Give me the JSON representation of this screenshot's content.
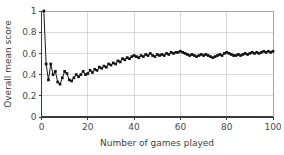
{
  "chart_data": {
    "type": "line",
    "title": "",
    "xlabel": "Number of games played",
    "ylabel": "Overall mean score",
    "xlim": [
      0,
      100
    ],
    "ylim": [
      0,
      1
    ],
    "grid": true,
    "legend": "none",
    "marker": "filled-square",
    "line_color": "#1a1a1a",
    "xticks": [
      0,
      20,
      40,
      60,
      80,
      100
    ],
    "xtick_labels": [
      "0",
      "20",
      "40",
      "60",
      "80",
      "100"
    ],
    "yticks": [
      0,
      0.2,
      0.4,
      0.6,
      0.8,
      1
    ],
    "ytick_labels": [
      "0",
      "0.2",
      "0.4",
      "0.6",
      "0.8",
      "1"
    ],
    "series": [
      {
        "name": "Overall mean score",
        "x": [
          1,
          2,
          3,
          4,
          5,
          6,
          7,
          8,
          9,
          10,
          11,
          12,
          13,
          14,
          15,
          16,
          17,
          18,
          19,
          20,
          21,
          22,
          23,
          24,
          25,
          26,
          27,
          28,
          29,
          30,
          31,
          32,
          33,
          34,
          35,
          36,
          37,
          38,
          39,
          40,
          41,
          42,
          43,
          44,
          45,
          46,
          47,
          48,
          49,
          50,
          51,
          52,
          53,
          54,
          55,
          56,
          57,
          58,
          59,
          60,
          61,
          62,
          63,
          64,
          65,
          66,
          67,
          68,
          69,
          70,
          71,
          72,
          73,
          74,
          75,
          76,
          77,
          78,
          79,
          80,
          81,
          82,
          83,
          84,
          85,
          86,
          87,
          88,
          89,
          90,
          91,
          92,
          93,
          94,
          95,
          96,
          97,
          98,
          99,
          100
        ],
        "values": [
          1.0,
          0.5,
          0.35,
          0.5,
          0.4,
          0.43,
          0.33,
          0.31,
          0.37,
          0.43,
          0.41,
          0.35,
          0.34,
          0.37,
          0.4,
          0.38,
          0.4,
          0.43,
          0.4,
          0.41,
          0.44,
          0.42,
          0.45,
          0.44,
          0.47,
          0.46,
          0.48,
          0.47,
          0.5,
          0.49,
          0.51,
          0.5,
          0.53,
          0.52,
          0.55,
          0.54,
          0.56,
          0.55,
          0.57,
          0.58,
          0.57,
          0.56,
          0.58,
          0.57,
          0.59,
          0.58,
          0.6,
          0.58,
          0.57,
          0.59,
          0.58,
          0.59,
          0.58,
          0.6,
          0.59,
          0.61,
          0.6,
          0.61,
          0.61,
          0.62,
          0.61,
          0.6,
          0.59,
          0.58,
          0.59,
          0.58,
          0.57,
          0.58,
          0.59,
          0.58,
          0.59,
          0.58,
          0.57,
          0.56,
          0.57,
          0.58,
          0.59,
          0.58,
          0.6,
          0.61,
          0.6,
          0.59,
          0.58,
          0.58,
          0.59,
          0.58,
          0.59,
          0.6,
          0.59,
          0.6,
          0.61,
          0.6,
          0.61,
          0.6,
          0.61,
          0.62,
          0.61,
          0.62,
          0.61,
          0.62
        ]
      }
    ]
  }
}
